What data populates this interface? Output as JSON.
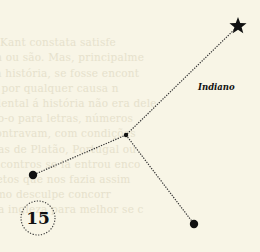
{
  "constellation": {
    "name": "Indiano",
    "page_number": "15",
    "colors": {
      "paper": "#f8f5e6",
      "ink": "#111111",
      "line": "#333333",
      "showthrough": "#e6e1cc"
    },
    "stars": [
      {
        "id": "top-star",
        "shape": "star"
      },
      {
        "id": "junction",
        "shape": "small-dot"
      },
      {
        "id": "left-star",
        "shape": "dot"
      },
      {
        "id": "bottom-star",
        "shape": "dot"
      }
    ],
    "links": [
      [
        "top-star",
        "junction"
      ],
      [
        "junction",
        "left-star"
      ],
      [
        "junction",
        "bottom-star"
      ]
    ]
  },
  "showthrough_lines": [
    "rbimento",
    "e Um verdadeiro Kant constata satisfe",
    "ue não funcionam ou são. Mas, principalme",
    "cidentes alterar a história, se fosse encont",
    "a Fisher cor que, por qualquer causa n",
    "e bonito mas acidental á história não era dele",
    "rerem, traduzindo-o para letras, números",
    "tais como se encontravam, com condições",
    "imagem e gravuras de Platão, Portugal ou",
    "as memórias e encontros se lá entrou enco",
    "em retorno alfabetos que nos fazia assim",
    "era falar, mas como desculpe concorr",
    "teleponte invasiva ingleza para melhor se c"
  ]
}
